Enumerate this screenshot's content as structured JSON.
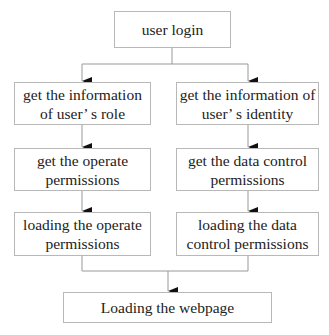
{
  "diagram": {
    "type": "flowchart",
    "nodes": {
      "start": {
        "label": "user login"
      },
      "left": [
        {
          "line1": "get the information",
          "line2": "of user’ s role"
        },
        {
          "line1": "get the operate",
          "line2": "permissions"
        },
        {
          "line1": "loading the operate",
          "line2": "permissions"
        }
      ],
      "right": [
        {
          "line1": "get the information of",
          "line2": "user’ s identity"
        },
        {
          "line1": "get the data control",
          "line2": "permissions"
        },
        {
          "line1": "loading the data",
          "line2": "control permissions"
        }
      ],
      "end": {
        "label": "Loading the webpage"
      }
    },
    "edges": [
      [
        "user login",
        "get the information of user’ s role"
      ],
      [
        "user login",
        "get the information of user’ s identity"
      ],
      [
        "get the information of user’ s role",
        "get the operate permissions"
      ],
      [
        "get the operate permissions",
        "loading the operate permissions"
      ],
      [
        "get the information of user’ s identity",
        "get the data control permissions"
      ],
      [
        "get the data control permissions",
        "loading the data control permissions"
      ],
      [
        "loading the operate permissions",
        "Loading the webpage"
      ],
      [
        "loading the data control permissions",
        "Loading the webpage"
      ]
    ]
  }
}
